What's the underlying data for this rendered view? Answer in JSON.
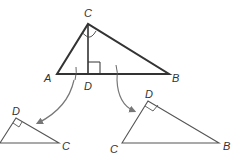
{
  "diagram": {
    "type": "geometry-similar-triangles",
    "colors": {
      "main_stroke": "#333333",
      "sub_stroke": "#555555",
      "arrow": "#777777",
      "label": "#333333"
    },
    "main_triangle": {
      "vertices": {
        "A": [
          57,
          74
        ],
        "B": [
          169,
          74
        ],
        "C": [
          88,
          24
        ],
        "D": [
          88,
          74
        ]
      },
      "labels": {
        "A": "A",
        "B": "B",
        "C": "C",
        "D": "D"
      },
      "altitude": "CD",
      "right_angle_at": "D"
    },
    "left_triangle": {
      "labels": {
        "D": "D",
        "C": "C"
      },
      "right_angle_at": "D"
    },
    "right_triangle": {
      "labels": {
        "D": "D",
        "C": "C",
        "B": "B"
      },
      "right_angle_at": "D"
    }
  }
}
